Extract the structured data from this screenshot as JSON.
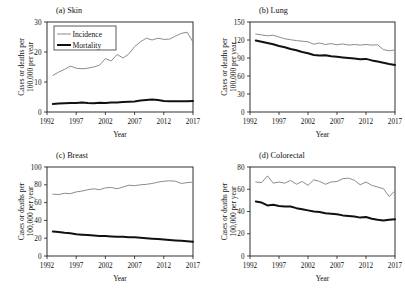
{
  "figure": {
    "background": "#ffffff",
    "incidence_color": "#8c8c8c",
    "mortality_color": "#111111",
    "incidence_width": 1.0,
    "mortality_width": 2.0
  },
  "legend": {
    "position": "top-left-panel-a",
    "entries": [
      {
        "label": "Incidence",
        "color": "#8c8c8c"
      },
      {
        "label": "Mortality",
        "color": "#111111"
      }
    ]
  },
  "chart_data": [
    {
      "type": "line",
      "title": "(a) Skin",
      "xlabel": "Year",
      "ylabel": "Cases or deaths per 100,000 per year",
      "xlim": [
        1992,
        2017
      ],
      "ylim": [
        0,
        30
      ],
      "xticks": [
        1992,
        1997,
        2002,
        2007,
        2012,
        2017
      ],
      "yticks": [
        0,
        10,
        20,
        30
      ],
      "grid": false,
      "x": [
        1993,
        1994,
        1995,
        1996,
        1997,
        1998,
        1999,
        2000,
        2001,
        2002,
        2003,
        2004,
        2005,
        2006,
        2007,
        2008,
        2009,
        2010,
        2011,
        2012,
        2013,
        2014,
        2015,
        2016,
        2017
      ],
      "series": [
        {
          "name": "Incidence",
          "color": "#8c8c8c",
          "values": [
            12.2,
            13.3,
            14.2,
            15.3,
            14.6,
            14.4,
            14.6,
            15.0,
            15.6,
            17.8,
            17.0,
            19.2,
            18.0,
            19.3,
            21.8,
            23.4,
            24.6,
            24.0,
            24.6,
            24.2,
            24.3,
            25.3,
            26.2,
            26.6,
            23.3
          ]
        },
        {
          "name": "Mortality",
          "color": "#111111",
          "values": [
            2.7,
            2.8,
            2.9,
            3.0,
            3.0,
            3.2,
            3.0,
            2.9,
            3.1,
            3.0,
            3.2,
            3.2,
            3.3,
            3.4,
            3.5,
            3.8,
            4.0,
            4.2,
            4.0,
            3.7,
            3.6,
            3.6,
            3.6,
            3.6,
            3.7
          ]
        }
      ]
    },
    {
      "type": "line",
      "title": "(b) Lung",
      "xlabel": "Year",
      "ylabel": "Cases or deaths per 100,000 per year",
      "xlim": [
        1992,
        2017
      ],
      "ylim": [
        0,
        150
      ],
      "xticks": [
        1992,
        1997,
        2002,
        2007,
        2012,
        2017
      ],
      "yticks": [
        0,
        30,
        60,
        90,
        120,
        150
      ],
      "grid": false,
      "x": [
        1993,
        1994,
        1995,
        1996,
        1997,
        1998,
        1999,
        2000,
        2001,
        2002,
        2003,
        2004,
        2005,
        2006,
        2007,
        2008,
        2009,
        2010,
        2011,
        2012,
        2013,
        2014,
        2015,
        2016,
        2017
      ],
      "series": [
        {
          "name": "Incidence",
          "color": "#8c8c8c",
          "values": [
            130.0,
            128.5,
            127.0,
            128.0,
            125.0,
            122.0,
            120.5,
            119.0,
            118.0,
            117.0,
            113.0,
            115.0,
            112.5,
            114.0,
            112.0,
            113.5,
            111.5,
            112.5,
            111.5,
            112.5,
            111.5,
            112.0,
            104.0,
            102.0,
            103.5
          ]
        },
        {
          "name": "Mortality",
          "color": "#111111",
          "values": [
            119.0,
            117.0,
            115.0,
            113.0,
            110.0,
            108.0,
            105.0,
            103.0,
            100.0,
            98.0,
            95.0,
            94.0,
            94.5,
            93.0,
            92.0,
            91.0,
            90.0,
            89.0,
            88.0,
            88.5,
            86.0,
            84.0,
            82.0,
            80.0,
            78.5
          ]
        }
      ]
    },
    {
      "type": "line",
      "title": "(c) Breast",
      "xlabel": "Year",
      "ylabel": "Cases or deaths per 100,000 per year",
      "xlim": [
        1992,
        2017
      ],
      "ylim": [
        0,
        100
      ],
      "xticks": [
        1992,
        1997,
        2002,
        2007,
        2012,
        2017
      ],
      "yticks": [
        0,
        20,
        40,
        60,
        80,
        100
      ],
      "grid": false,
      "x": [
        1993,
        1994,
        1995,
        1996,
        1997,
        1998,
        1999,
        2000,
        2001,
        2002,
        2003,
        2004,
        2005,
        2006,
        2007,
        2008,
        2009,
        2010,
        2011,
        2012,
        2013,
        2014,
        2015,
        2016,
        2017
      ],
      "series": [
        {
          "name": "Incidence",
          "color": "#8c8c8c",
          "values": [
            69.5,
            69.0,
            70.5,
            70.0,
            72.0,
            73.0,
            74.5,
            75.5,
            74.5,
            76.5,
            77.0,
            75.5,
            77.5,
            79.5,
            79.0,
            80.0,
            80.5,
            81.5,
            83.0,
            84.0,
            84.5,
            84.0,
            81.5,
            82.5,
            83.0
          ]
        },
        {
          "name": "Mortality",
          "color": "#111111",
          "values": [
            27.5,
            27.0,
            26.0,
            25.5,
            24.5,
            24.0,
            23.5,
            23.0,
            22.5,
            22.5,
            22.0,
            21.5,
            21.5,
            21.0,
            21.0,
            20.5,
            20.0,
            19.5,
            19.0,
            18.5,
            18.0,
            17.5,
            17.0,
            16.5,
            16.0
          ]
        }
      ]
    },
    {
      "type": "line",
      "title": "(d) Colorectal",
      "xlabel": "Year",
      "ylabel": "Cases or deaths per 100,000 per year",
      "xlim": [
        1992,
        2017
      ],
      "ylim": [
        0,
        80
      ],
      "xticks": [
        1992,
        1997,
        2002,
        2007,
        2012,
        2017
      ],
      "yticks": [
        0,
        20,
        40,
        60,
        80
      ],
      "grid": false,
      "x": [
        1993,
        1994,
        1995,
        1996,
        1997,
        1998,
        1999,
        2000,
        2001,
        2002,
        2003,
        2004,
        2005,
        2006,
        2007,
        2008,
        2009,
        2010,
        2011,
        2012,
        2013,
        2014,
        2015,
        2016,
        2017
      ],
      "series": [
        {
          "name": "Incidence",
          "color": "#8c8c8c",
          "values": [
            66.5,
            66.0,
            72.0,
            65.5,
            66.5,
            65.5,
            68.0,
            64.5,
            67.0,
            63.5,
            68.5,
            67.0,
            64.5,
            66.5,
            67.0,
            69.5,
            70.0,
            68.0,
            64.0,
            66.5,
            63.5,
            62.0,
            60.5,
            53.5,
            58.5
          ]
        },
        {
          "name": "Mortality",
          "color": "#111111",
          "values": [
            49.0,
            48.0,
            45.5,
            46.0,
            45.0,
            44.5,
            44.5,
            43.0,
            42.0,
            41.0,
            40.0,
            39.5,
            38.5,
            38.0,
            37.5,
            36.5,
            36.0,
            35.5,
            34.5,
            35.0,
            33.5,
            32.5,
            32.0,
            32.5,
            33.0
          ]
        }
      ]
    }
  ]
}
